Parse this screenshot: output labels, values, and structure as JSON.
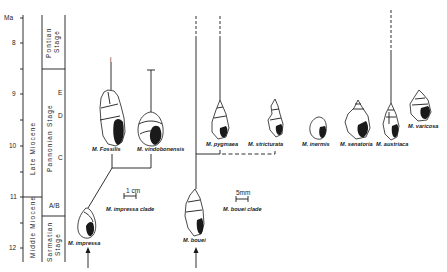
{
  "axis": {
    "unit": "Ma",
    "ticks": [
      {
        "label": "8",
        "y": 43
      },
      {
        "label": "9",
        "y": 94
      },
      {
        "label": "10",
        "y": 146
      },
      {
        "label": "11",
        "y": 197
      },
      {
        "label": "12",
        "y": 248
      }
    ]
  },
  "epochs": {
    "late": "Late   Miocene",
    "middle": "Middle Miocene"
  },
  "stages": {
    "pontian_1": "Pontian",
    "pontian_2": "Stage",
    "pannonian": "Pannonian Stage",
    "sarmatian_1": "Sarmatian",
    "sarmatian_2": "Stage",
    "zone_e": "E",
    "zone_d": "D",
    "zone_c": "C",
    "zone_ab": "A/B"
  },
  "species": {
    "fossilis": "M. Fossilis",
    "vindobonensis": "M. vindobonensis",
    "impressa": "M. impressa",
    "pygmaea": "M. pygmaea",
    "stricturata": "M. stricturata",
    "inermis": "M. inermis",
    "senatoria": "M. senatoria",
    "austriaca": "M. austriaca",
    "varicosa": "M. varicosa",
    "bouei": "M. bouei"
  },
  "clades": {
    "impressa": "M. impressa clade",
    "bouei": "M. bouei clade"
  },
  "scales": {
    "cm": "1 cm",
    "mm": "5mm"
  }
}
